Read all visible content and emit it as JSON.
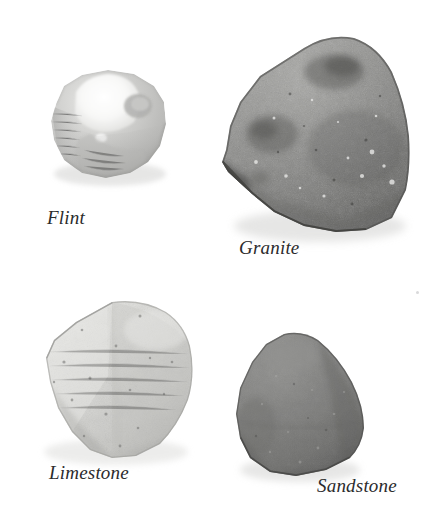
{
  "figure": {
    "kind": "rock-specimen-plate",
    "background_color": "#ffffff",
    "cropped_top_text": "",
    "specimen_count": 4
  },
  "specimens": [
    {
      "id": "flint",
      "caption": "Flint",
      "description": "Pale gray nodular flint pebble with bright white fractured highlight on upper face",
      "colors": {
        "base": "#cfcfcd",
        "mid": "#bcbcba",
        "shadow": "#9d9d9b",
        "highlight": "#fbfbfa",
        "edge": "#8e8e8c"
      },
      "bounds": {
        "x": 43,
        "y": 72,
        "width": 128,
        "height": 110
      },
      "caption_position": {
        "x": 47,
        "y": 208
      }
    },
    {
      "id": "granite",
      "caption": "Granite",
      "description": "Large dark gray speckled granite block, broad fan-shaped outline with coarse mottled crystal texture",
      "colors": {
        "base": "#8d8d8b",
        "mid": "#7c7c7a",
        "shadow": "#5c5c5a",
        "highlight": "#b6b6b3",
        "edge": "#4a4a48"
      },
      "bounds": {
        "x": 222,
        "y": 35,
        "width": 190,
        "height": 196
      },
      "caption_position": {
        "x": 239,
        "y": 238
      }
    },
    {
      "id": "limestone",
      "caption": "Limestone",
      "description": "Light gray limestone slab, angular pentagonal outline with fine dark speckling",
      "colors": {
        "base": "#d8d8d5",
        "mid": "#cacac7",
        "shadow": "#aeaeab",
        "highlight": "#efefed",
        "edge": "#9a9a97"
      },
      "bounds": {
        "x": 26,
        "y": 300,
        "width": 170,
        "height": 156
      },
      "caption_position": {
        "x": 49,
        "y": 463
      }
    },
    {
      "id": "sandstone",
      "caption": "Sandstone",
      "description": "Medium dark gray sandstone with smooth rounded triangular outline and even fine grain",
      "colors": {
        "base": "#7e7e7c",
        "mid": "#737371",
        "shadow": "#5e5e5c",
        "highlight": "#949492",
        "edge": "#4f4f4d"
      },
      "bounds": {
        "x": 228,
        "y": 335,
        "width": 136,
        "height": 140
      },
      "caption_position": {
        "x": 317,
        "y": 476
      }
    }
  ]
}
